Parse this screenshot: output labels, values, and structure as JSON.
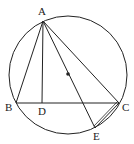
{
  "diagram": {
    "type": "geometry",
    "circle": {
      "cx": 68,
      "cy": 75,
      "r": 59
    },
    "center_dot": {
      "x": 68,
      "y": 74
    },
    "points": {
      "A": {
        "x": 43,
        "y": 21,
        "label": "A"
      },
      "B": {
        "x": 16,
        "y": 103,
        "label": "B"
      },
      "D": {
        "x": 42,
        "y": 103,
        "label": "D"
      },
      "C": {
        "x": 119,
        "y": 103,
        "label": "C"
      },
      "E": {
        "x": 95,
        "y": 128,
        "label": "E"
      }
    },
    "segments": [
      "AB",
      "AC",
      "BC",
      "AD",
      "AE",
      "CE"
    ],
    "labels": {
      "A": "A",
      "B": "B",
      "C": "C",
      "D": "D",
      "E": "E"
    },
    "stroke_color": "#222222"
  }
}
